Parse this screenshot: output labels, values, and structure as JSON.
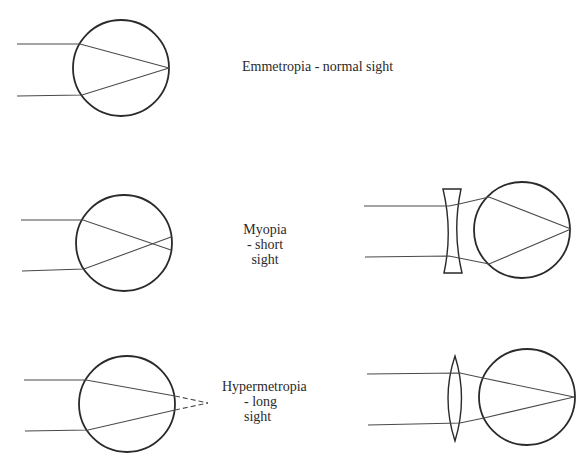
{
  "diagram": {
    "panels": [
      {
        "id": "emmetropia",
        "label_lines": [
          "Emmetropia - normal sight"
        ],
        "focus": "on retina",
        "correction": "none"
      },
      {
        "id": "myopia",
        "label_lines": [
          "Myopia",
          "- short",
          "sight"
        ],
        "focus": "in front of retina",
        "correction": "concave (diverging) lens"
      },
      {
        "id": "hypermetropia",
        "label_lines": [
          "Hypermetropia",
          "- long",
          "sight"
        ],
        "focus": "behind retina (dashed extension)",
        "correction": "convex (converging) lens"
      }
    ],
    "colors": {
      "outline": "#2a2a2a",
      "rays": "#4a4a4a",
      "background": "#ffffff"
    }
  }
}
